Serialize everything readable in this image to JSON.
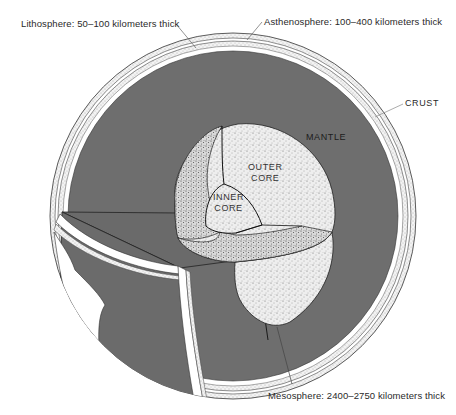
{
  "diagram": {
    "labels": {
      "lithosphere": "Lithosphere:  50–100 kilometers thick",
      "asthenosphere": "Asthenosphere:  100–400 kilometers thick",
      "crust": "CRUST",
      "mantle": "MANTLE",
      "outer_core_line1": "OUTER",
      "outer_core_line2": "CORE",
      "inner_core_line1": "INNER",
      "inner_core_line2": "CORE",
      "mesosphere": "Mesosphere:  2400–2750 kilometers thick"
    },
    "colors": {
      "mantle": "#6e6e6e",
      "core_stipple": "#e8e8e8",
      "shell_white": "#ffffff",
      "line": "#222222",
      "background": "#ffffff"
    }
  }
}
